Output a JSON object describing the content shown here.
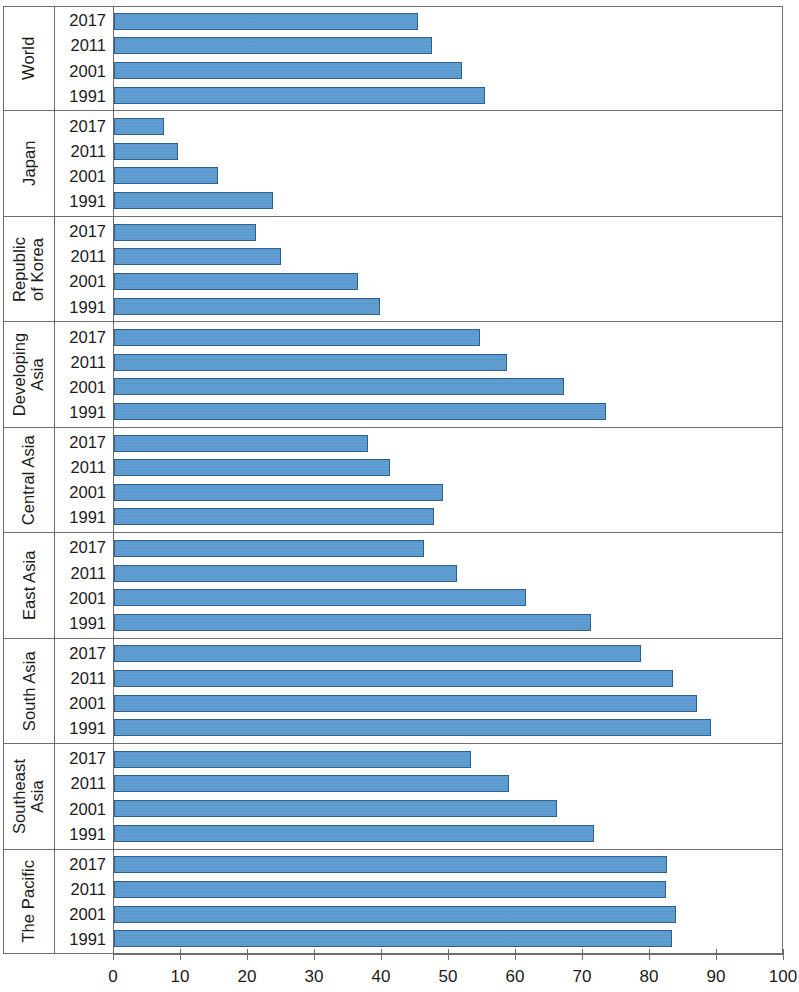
{
  "chart": {
    "type": "bar",
    "orientation": "horizontal",
    "bar_color": "#5b9bd1",
    "bar_border_color": "#2f5f8a",
    "frame_color": "#6d6d6d"
  },
  "axis": {
    "xlabel": "",
    "ylabel": "",
    "xlim": [
      0,
      100
    ],
    "ticks": [
      {
        "value": 0,
        "label": "0"
      },
      {
        "value": 10,
        "label": "10"
      },
      {
        "value": 20,
        "label": "20"
      },
      {
        "value": 30,
        "label": "30"
      },
      {
        "value": 40,
        "label": "40"
      },
      {
        "value": 50,
        "label": "50"
      },
      {
        "value": 60,
        "label": "60"
      },
      {
        "value": 70,
        "label": "70"
      },
      {
        "value": 80,
        "label": "80"
      },
      {
        "value": 90,
        "label": "90"
      },
      {
        "value": 100,
        "label": "100"
      }
    ]
  },
  "years": [
    "2017",
    "2011",
    "2001",
    "1991"
  ],
  "groups": [
    {
      "label": "World",
      "label_lines": "World",
      "rows": [
        {
          "year": "2017",
          "value": 45.4
        },
        {
          "year": "2011",
          "value": 47.6
        },
        {
          "year": "2001",
          "value": 52.0
        },
        {
          "year": "1991",
          "value": 55.4
        }
      ]
    },
    {
      "label": "Japan",
      "label_lines": "Japan",
      "rows": [
        {
          "year": "2017",
          "value": 7.4
        },
        {
          "year": "2011",
          "value": 9.6
        },
        {
          "year": "2001",
          "value": 15.6
        },
        {
          "year": "1991",
          "value": 23.7
        }
      ]
    },
    {
      "label": "Republic of Korea",
      "label_lines": "Republic\nof Korea",
      "rows": [
        {
          "year": "2017",
          "value": 21.2
        },
        {
          "year": "2011",
          "value": 25.0
        },
        {
          "year": "2001",
          "value": 36.4
        },
        {
          "year": "1991",
          "value": 39.8
        }
      ]
    },
    {
      "label": "Developing Asia",
      "label_lines": "Developing\nAsia",
      "rows": [
        {
          "year": "2017",
          "value": 54.7
        },
        {
          "year": "2011",
          "value": 58.8
        },
        {
          "year": "2001",
          "value": 67.3
        },
        {
          "year": "1991",
          "value": 73.6
        }
      ]
    },
    {
      "label": "Central Asia",
      "label_lines": "Central Asia",
      "rows": [
        {
          "year": "2017",
          "value": 38.0
        },
        {
          "year": "2011",
          "value": 41.3
        },
        {
          "year": "2001",
          "value": 49.2
        },
        {
          "year": "1991",
          "value": 47.8
        }
      ]
    },
    {
      "label": "East Asia",
      "label_lines": "East Asia",
      "rows": [
        {
          "year": "2017",
          "value": 46.4
        },
        {
          "year": "2011",
          "value": 51.2
        },
        {
          "year": "2001",
          "value": 61.6
        },
        {
          "year": "1991",
          "value": 71.3
        }
      ]
    },
    {
      "label": "South Asia",
      "label_lines": "South Asia",
      "rows": [
        {
          "year": "2017",
          "value": 78.8
        },
        {
          "year": "2011",
          "value": 83.6
        },
        {
          "year": "2001",
          "value": 87.2
        },
        {
          "year": "1991",
          "value": 89.2
        }
      ]
    },
    {
      "label": "Southeast Asia",
      "label_lines": "Southeast\nAsia",
      "rows": [
        {
          "year": "2017",
          "value": 53.3
        },
        {
          "year": "2011",
          "value": 59.0
        },
        {
          "year": "2001",
          "value": 66.2
        },
        {
          "year": "1991",
          "value": 71.8
        }
      ]
    },
    {
      "label": "The Pacific",
      "label_lines": "The Pacific",
      "rows": [
        {
          "year": "2017",
          "value": 82.6
        },
        {
          "year": "2011",
          "value": 82.5
        },
        {
          "year": "2001",
          "value": 84.0
        },
        {
          "year": "1991",
          "value": 83.4
        }
      ]
    }
  ],
  "chart_data": {
    "type": "bar",
    "title": "",
    "subtitle": "",
    "xlabel": "",
    "ylabel": "",
    "xlim": [
      0,
      100
    ],
    "grid": false,
    "legend": "none",
    "orientation": "horizontal",
    "categories": [
      "World",
      "Japan",
      "Republic of Korea",
      "Developing Asia",
      "Central Asia",
      "East Asia",
      "South Asia",
      "Southeast Asia",
      "The Pacific"
    ],
    "series": [
      {
        "name": "2017",
        "values": [
          45.4,
          7.4,
          21.2,
          54.7,
          38.0,
          46.4,
          78.8,
          53.3,
          82.6
        ]
      },
      {
        "name": "2011",
        "values": [
          47.6,
          9.6,
          25.0,
          58.8,
          41.3,
          51.2,
          83.6,
          59.0,
          82.5
        ]
      },
      {
        "name": "2001",
        "values": [
          52.0,
          15.6,
          36.4,
          67.3,
          49.2,
          61.6,
          87.2,
          66.2,
          84.0
        ]
      },
      {
        "name": "1991",
        "values": [
          55.4,
          23.7,
          39.8,
          73.6,
          47.8,
          71.3,
          89.2,
          71.8,
          83.4
        ]
      }
    ],
    "tick_labels": [
      "0",
      "10",
      "20",
      "30",
      "40",
      "50",
      "60",
      "70",
      "80",
      "90",
      "100"
    ]
  }
}
